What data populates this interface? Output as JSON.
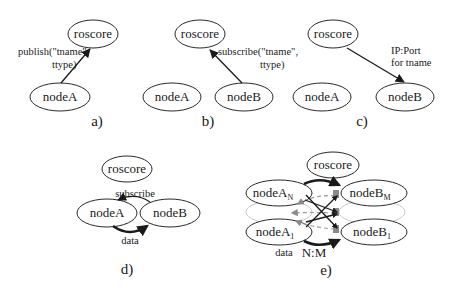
{
  "figure": {
    "panels": [
      {
        "id": "a",
        "caption": "a)",
        "nodes": [
          "roscore",
          "nodeA"
        ],
        "edge_label_line1": "publish(\"tname\",",
        "edge_label_line2": "ttype)"
      },
      {
        "id": "b",
        "caption": "b)",
        "nodes": [
          "roscore",
          "nodeA",
          "nodeB"
        ],
        "edge_label_line1": "subscribe(\"tname\",",
        "edge_label_line2": "ttype)"
      },
      {
        "id": "c",
        "caption": "c)",
        "nodes": [
          "roscore",
          "nodeA",
          "nodeB"
        ],
        "edge_label_line1": "IP:Port",
        "edge_label_line2": "for tname"
      },
      {
        "id": "d",
        "caption": "d)",
        "nodes": [
          "roscore",
          "nodeA",
          "nodeB"
        ],
        "edge_label_top": "subscribe",
        "edge_label_bottom": "data"
      },
      {
        "id": "e",
        "caption": "e)",
        "nodes": {
          "roscore": "roscore",
          "a_n": "nodeA",
          "a_n_sub": "N",
          "a_1": "nodeA",
          "a_1_sub": "1",
          "b_m": "nodeB",
          "b_m_sub": "M",
          "b_1": "nodeB",
          "b_1_sub": "1"
        },
        "edge_label_data": "data",
        "edge_label_ratio": "N:M"
      }
    ],
    "colors": {
      "stroke": "#2a2a2a",
      "dashed": "#9a9a9a",
      "faint_node": "#c8c8c8",
      "arrow_gray": "#8a8a8a"
    }
  }
}
